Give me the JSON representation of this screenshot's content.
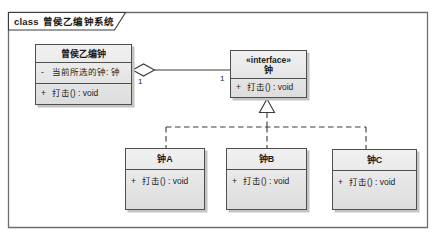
{
  "diagram": {
    "frame_keyword": "class",
    "frame_title": "曾侯乙编钟系统"
  },
  "main_class": {
    "name": "曾侯乙编钟",
    "attribute_visibility": "-",
    "attribute_text": "当前所选的钟: 钟",
    "operation_visibility": "+",
    "operation_text": "打击() : void"
  },
  "interface_class": {
    "stereotype": "«interface»",
    "name": "钟",
    "operation_visibility": "+",
    "operation_text": "打击() : void"
  },
  "subclasses": [
    {
      "name": "钟A",
      "operation_visibility": "+",
      "operation_text": "打击() : void"
    },
    {
      "name": "钟B",
      "operation_visibility": "+",
      "operation_text": "打击() : void"
    },
    {
      "name": "钟C",
      "operation_visibility": "+",
      "operation_text": "打击() : void"
    }
  ],
  "relations": {
    "aggregation_source_multiplicity": "1",
    "aggregation_target_multiplicity": "1"
  },
  "colors": {
    "box_fill_top": "#f1f1f1",
    "box_fill_bottom": "#dddddd",
    "box_border": "#4f4f4f",
    "box_shadow": "#c3c3c3",
    "frame_border": "#6e6e6e",
    "line": "#3c3c3c",
    "text": "#1c1c1c"
  }
}
